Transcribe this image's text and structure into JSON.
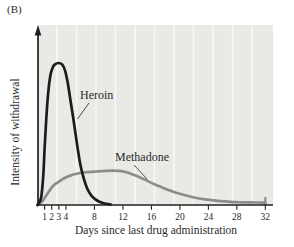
{
  "figure": {
    "panel_label": "(B)",
    "y_axis_label": "Intensity of withdrawal",
    "x_axis_label": "Days since last drug administration"
  },
  "annotations": {
    "heroin_label": "Heroin",
    "methadone_label": "Methadone"
  },
  "colors": {
    "plot_background": "#e9e9e6",
    "gridline": "#f8f8f6",
    "axis": "#1f1f1f",
    "text": "#2b2b2b",
    "heroin_curve": "#1c1c1c",
    "methadone_curve": "#8c8c8a"
  },
  "chart_data": {
    "type": "line",
    "title": "",
    "xlabel": "Days since last drug administration",
    "ylabel": "Intensity of withdrawal",
    "xlim": [
      0,
      33
    ],
    "ylim": [
      0,
      1.27
    ],
    "y_units": "arbitrary (no y ticks shown)",
    "x_ticks": [
      1,
      2,
      3,
      4,
      8,
      12,
      16,
      20,
      24,
      28,
      32
    ],
    "grid": "faint vertical lines on gray panel",
    "legend_position": "inline labels with leader lines",
    "series": [
      {
        "name": "Methadone",
        "color": "#8c8c8a",
        "end_cap_at_x": 32,
        "points": [
          [
            0,
            0
          ],
          [
            0.7,
            0.028
          ],
          [
            1.4,
            0.08
          ],
          [
            2.2,
            0.135
          ],
          [
            3.0,
            0.165
          ],
          [
            3.8,
            0.19
          ],
          [
            4.6,
            0.207
          ],
          [
            5.5,
            0.22
          ],
          [
            6.5,
            0.229
          ],
          [
            7.5,
            0.234
          ],
          [
            8.5,
            0.237
          ],
          [
            9.5,
            0.24
          ],
          [
            10.5,
            0.242
          ],
          [
            11.5,
            0.24
          ],
          [
            12.5,
            0.23
          ],
          [
            13.5,
            0.213
          ],
          [
            14.5,
            0.192
          ],
          [
            15.5,
            0.168
          ],
          [
            16.5,
            0.145
          ],
          [
            17.5,
            0.124
          ],
          [
            18.5,
            0.104
          ],
          [
            19.5,
            0.086
          ],
          [
            20.5,
            0.072
          ],
          [
            22,
            0.053
          ],
          [
            23.5,
            0.04
          ],
          [
            25,
            0.031
          ],
          [
            26.5,
            0.025
          ],
          [
            28,
            0.02
          ],
          [
            30,
            0.018
          ],
          [
            32,
            0.017
          ]
        ]
      },
      {
        "name": "Heroin",
        "color": "#1c1c1c",
        "points": [
          [
            0,
            0
          ],
          [
            0.5,
            0.05
          ],
          [
            0.8,
            0.2
          ],
          [
            1.0,
            0.4
          ],
          [
            1.25,
            0.62
          ],
          [
            1.5,
            0.79
          ],
          [
            1.8,
            0.91
          ],
          [
            2.1,
            0.965
          ],
          [
            2.45,
            0.99
          ],
          [
            2.95,
            1.0
          ],
          [
            3.45,
            0.99
          ],
          [
            3.85,
            0.95
          ],
          [
            4.25,
            0.86
          ],
          [
            4.65,
            0.73
          ],
          [
            5.05,
            0.6
          ],
          [
            5.55,
            0.43
          ],
          [
            6.0,
            0.29
          ],
          [
            6.5,
            0.185
          ],
          [
            7.0,
            0.115
          ],
          [
            7.6,
            0.065
          ],
          [
            8.35,
            0.032
          ],
          [
            9.3,
            0.012
          ],
          [
            10.3,
            0.003
          ]
        ]
      }
    ]
  }
}
